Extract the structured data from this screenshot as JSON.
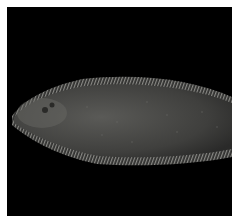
{
  "image": {
    "subject": "flatfish (sole) specimen, dorsal view, head facing left",
    "background_color": "#000000",
    "border_color": "#ffffff",
    "fish_body_color": "#4a4a48",
    "fin_fringe_color": "#8a8a86"
  }
}
